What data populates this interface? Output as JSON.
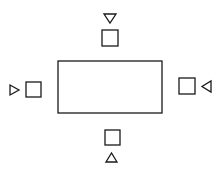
{
  "diagram": {
    "type": "seating-layout",
    "stroke_color": "#1a1a1a",
    "background": "#ffffff",
    "table": {
      "shape": "rectangle",
      "x": 58,
      "y": 61,
      "width": 104,
      "height": 52
    },
    "seats": [
      {
        "position": "top",
        "square": {
          "x": 102,
          "y": 30,
          "size": 16
        },
        "marker": {
          "direction": "down",
          "points": "104,14 116,14 110,23"
        }
      },
      {
        "position": "left",
        "square": {
          "x": 26,
          "y": 82,
          "size": 15
        },
        "marker": {
          "direction": "right",
          "points": "10,85 10,95 19,90"
        }
      },
      {
        "position": "right",
        "square": {
          "x": 179,
          "y": 78,
          "size": 16
        },
        "marker": {
          "direction": "left",
          "points": "211,81 211,92 202,86.5"
        }
      },
      {
        "position": "bottom",
        "square": {
          "x": 105,
          "y": 130,
          "size": 15
        },
        "marker": {
          "direction": "up",
          "points": "106,162 117,162 111.5,153"
        }
      }
    ]
  }
}
